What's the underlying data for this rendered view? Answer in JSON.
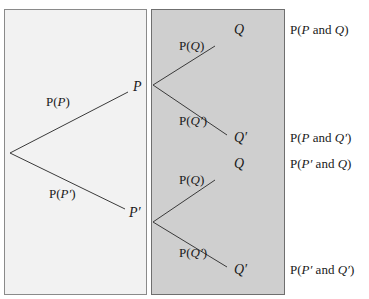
{
  "diagram": {
    "type": "probability-tree",
    "colors": {
      "left_panel_bg": "#f2f2f2",
      "right_panel_bg": "#cfcfcf",
      "line": "#3a3a3a"
    },
    "first_stage": {
      "root": "",
      "branches": [
        {
          "label_prefix": "P(",
          "label_var": "P",
          "label_suffix": ")",
          "node": "P"
        },
        {
          "label_prefix": "P(",
          "label_var": "P′",
          "label_suffix": ")",
          "node": "P′"
        }
      ]
    },
    "second_stage": {
      "upper": [
        {
          "label_prefix": "P(",
          "label_var": "Q",
          "label_suffix": ")",
          "node": "Q"
        },
        {
          "label_prefix": "P(",
          "label_var": "Q′",
          "label_suffix": ")",
          "node": "Q′"
        }
      ],
      "lower": [
        {
          "label_prefix": "P(",
          "label_var": "Q",
          "label_suffix": ")",
          "node": "Q"
        },
        {
          "label_prefix": "P(",
          "label_var": "Q′",
          "label_suffix": ")",
          "node": "Q′"
        }
      ]
    },
    "outcomes": [
      {
        "prefix": "P(",
        "a": "P",
        "mid": " and ",
        "b": "Q",
        "suffix": ")"
      },
      {
        "prefix": "P(",
        "a": "P",
        "mid": " and ",
        "b": "Q′",
        "suffix": ")"
      },
      {
        "prefix": "P(",
        "a": "P′",
        "mid": " and ",
        "b": "Q",
        "suffix": ")"
      },
      {
        "prefix": "P(",
        "a": "P′",
        "mid": " and ",
        "b": "Q′",
        "suffix": ")"
      }
    ]
  }
}
